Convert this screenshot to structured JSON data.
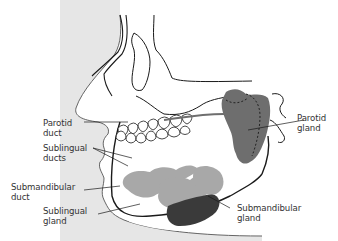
{
  "diagram": {
    "type": "anatomical illustration",
    "colors": {
      "background": "#ffffff",
      "skin_fill": "#e6e6e6",
      "outline": "#1a1a1a",
      "parotid_gland": "#6e6e6e",
      "sublingual_gland": "#a8a8a8",
      "submandibular_gland": "#3a3a3a",
      "label_text": "#333333"
    },
    "labels": [
      {
        "id": "parotid-duct",
        "line1": "Parotid",
        "line2": "duct",
        "side": "left"
      },
      {
        "id": "sublingual-ducts",
        "line1": "Sublingual",
        "line2": "ducts",
        "side": "left"
      },
      {
        "id": "submandibular-duct",
        "line1": "Submandibular",
        "line2": "duct",
        "side": "left"
      },
      {
        "id": "sublingual-gland",
        "line1": "Sublingual",
        "line2": "gland",
        "side": "left"
      },
      {
        "id": "parotid-gland",
        "line1": "Parotid",
        "line2": "gland",
        "side": "right"
      },
      {
        "id": "submandibular-gland",
        "line1": "Submandibular",
        "line2": "gland",
        "side": "right"
      }
    ]
  }
}
